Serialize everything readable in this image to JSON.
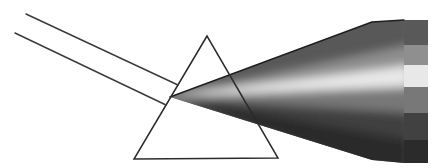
{
  "canvas": {
    "width": 439,
    "height": 168,
    "background": "#ffffff"
  },
  "diagram": {
    "ray_color": "#3a3a3a",
    "ray_width": 1.4,
    "incident_rays": [
      {
        "x1": 26,
        "y1": 14,
        "x2": 178,
        "y2": 85
      },
      {
        "x1": 15,
        "y1": 33,
        "x2": 166,
        "y2": 105
      }
    ],
    "prism": {
      "points": "207,36 134,159 278,158",
      "stroke": "#2b2b2b",
      "stroke_width": 1.5,
      "fill": "none"
    },
    "beam": {
      "outline_points": "170,97 372,22 404,20 404,163 372,160",
      "base_fill": "#777777",
      "top_edge_points": "170,97 372,22 404,20",
      "top_edge_color": "#1f1f1f",
      "top_edge_width": 1.5,
      "blur": 5,
      "wedges": [
        {
          "points": "162,99 366,10 410,10 410,45",
          "color": "#595959"
        },
        {
          "points": "162,97 410,45 410,65",
          "color": "#8f8f8f"
        },
        {
          "points": "162,97 410,65 410,87",
          "color": "#e8e8e8"
        },
        {
          "points": "162,97 410,87 410,113",
          "color": "#787878"
        },
        {
          "points": "162,97 410,113 410,140",
          "color": "#414141"
        },
        {
          "points": "162,95 410,140 410,172 366,170",
          "color": "#2b2b2b"
        }
      ]
    },
    "spectrum_band": {
      "x": 404,
      "width": 24,
      "stripes": [
        {
          "y": 20,
          "height": 25,
          "color": "#595959"
        },
        {
          "y": 45,
          "height": 20,
          "color": "#8f8f8f"
        },
        {
          "y": 65,
          "height": 22,
          "color": "#e8e8e8"
        },
        {
          "y": 87,
          "height": 26,
          "color": "#787878"
        },
        {
          "y": 113,
          "height": 27,
          "color": "#414141"
        },
        {
          "y": 140,
          "height": 23,
          "color": "#2b2b2b"
        }
      ]
    }
  }
}
